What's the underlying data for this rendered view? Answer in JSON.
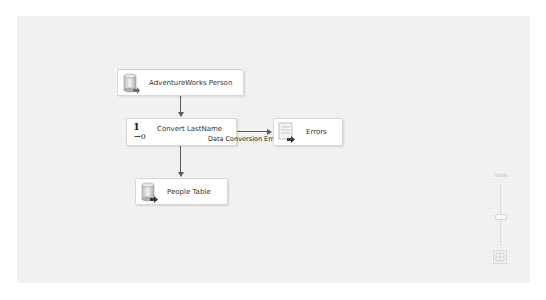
{
  "designer": {
    "nodes": [
      {
        "id": "source",
        "label": "AdventureWorks Person",
        "icon": "database-source-icon"
      },
      {
        "id": "convert",
        "label": "Convert LastName",
        "icon": "data-conversion-icon",
        "icon_glyph_top": "1",
        "icon_glyph_bottom": "→0"
      },
      {
        "id": "errors",
        "label": "Errors",
        "icon": "flat-file-destination-icon"
      },
      {
        "id": "destination",
        "label": "People Table",
        "icon": "database-destination-icon"
      }
    ],
    "paths": [
      {
        "from": "source",
        "to": "convert",
        "label": ""
      },
      {
        "from": "convert",
        "to": "errors",
        "label": "Data Conversion Error Output"
      },
      {
        "from": "convert",
        "to": "destination",
        "label": ""
      }
    ]
  },
  "zoom_control": {
    "level": "100%"
  }
}
